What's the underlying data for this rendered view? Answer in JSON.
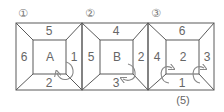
{
  "colors": {
    "line": "#5a5a5a",
    "text": "#666666",
    "arrow": "#888888"
  },
  "figures": [
    {
      "number": "①",
      "center": "A",
      "top": "5",
      "left": "6",
      "right": "1",
      "bottom": "2"
    },
    {
      "number": "②",
      "center": "B",
      "top": "4",
      "left": "5",
      "right": "2",
      "bottom": "3"
    },
    {
      "number": "③",
      "center": "2",
      "top": "6",
      "left": "4",
      "right": "3",
      "bottom": "1"
    }
  ],
  "caption": "(5)"
}
